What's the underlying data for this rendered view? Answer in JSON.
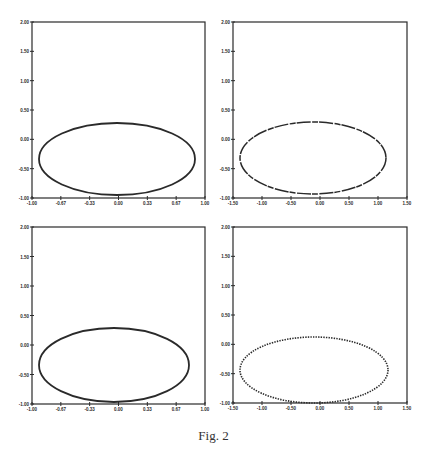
{
  "figure": {
    "caption": "Fig. 2",
    "stroke_color": "#2a2a2a"
  },
  "chart_data": [
    {
      "type": "line",
      "panel": "top-left",
      "title": "",
      "xlabel": "",
      "ylabel": "",
      "xlim": [
        -1.0,
        1.0
      ],
      "ylim": [
        -1.0,
        2.0
      ],
      "xticks": [
        "-1.00",
        "-0.67",
        "-0.33",
        "0.00",
        "0.33",
        "0.67",
        "1.00"
      ],
      "yticks": [
        "2.00",
        "1.50",
        "1.00",
        "0.50",
        "0.00",
        "-0.50",
        "-1.00"
      ],
      "grid": false,
      "style": "solid",
      "series": [
        {
          "name": "ellipse",
          "center": [
            -0.09,
            -0.23
          ],
          "rx": 0.9,
          "ry": 0.61
        }
      ]
    },
    {
      "type": "line",
      "panel": "top-right",
      "title": "",
      "xlabel": "",
      "ylabel": "",
      "xlim": [
        -1.5,
        1.5
      ],
      "ylim": [
        -1.0,
        2.0
      ],
      "xticks": [
        "-1.50",
        "-1.00",
        "-0.50",
        "0.00",
        "0.50",
        "1.00",
        "1.50"
      ],
      "yticks": [
        "2.00",
        "1.50",
        "1.00",
        "0.50",
        "0.00",
        "-0.50",
        "-1.00"
      ],
      "grid": false,
      "style": "broken",
      "series": [
        {
          "name": "ellipse",
          "center": [
            -0.15,
            -0.25
          ],
          "rx": 1.26,
          "ry": 0.61
        }
      ]
    },
    {
      "type": "line",
      "panel": "bottom-left",
      "title": "",
      "xlabel": "",
      "ylabel": "",
      "xlim": [
        -1.0,
        1.0
      ],
      "ylim": [
        -1.0,
        2.0
      ],
      "xticks": [
        "-1.00",
        "-0.67",
        "-0.33",
        "0.00",
        "0.33",
        "0.67",
        "1.00"
      ],
      "yticks": [
        "2.00",
        "1.50",
        "1.00",
        "0.50",
        "0.00",
        "-0.50",
        "-1.00"
      ],
      "grid": false,
      "style": "solid",
      "series": [
        {
          "name": "ellipse",
          "center": [
            -0.12,
            -0.28
          ],
          "rx": 0.87,
          "ry": 0.63
        }
      ]
    },
    {
      "type": "scatter",
      "panel": "bottom-right",
      "title": "",
      "xlabel": "",
      "ylabel": "",
      "xlim": [
        -1.5,
        1.5
      ],
      "ylim": [
        -1.0,
        2.0
      ],
      "xticks": [
        "-1.50",
        "-1.00",
        "-0.50",
        "0.00",
        "0.50",
        "1.00",
        "1.50"
      ],
      "yticks": [
        "2.00",
        "1.50",
        "1.00",
        "0.50",
        "0.00",
        "-0.50",
        "-1.00"
      ],
      "grid": false,
      "style": "dotted",
      "series": [
        {
          "name": "ellipse points",
          "center": [
            -0.13,
            -0.44
          ],
          "rx": 1.28,
          "ry": 0.56
        }
      ]
    }
  ],
  "panels": [
    {
      "x": 32,
      "y": 22,
      "w": 173,
      "h": 176,
      "cx": 117,
      "cy": 159,
      "rx": 78,
      "ry": 36,
      "style": "solid"
    },
    {
      "x": 233,
      "y": 22,
      "w": 174,
      "h": 176,
      "cx": 313,
      "cy": 158,
      "rx": 73,
      "ry": 36,
      "style": "broken"
    },
    {
      "x": 32,
      "y": 227,
      "w": 173,
      "h": 177,
      "cx": 114,
      "cy": 365,
      "rx": 75,
      "ry": 37,
      "style": "solid"
    },
    {
      "x": 233,
      "y": 227,
      "w": 174,
      "h": 176,
      "cx": 314,
      "cy": 370,
      "rx": 74,
      "ry": 33,
      "style": "dotted"
    }
  ]
}
